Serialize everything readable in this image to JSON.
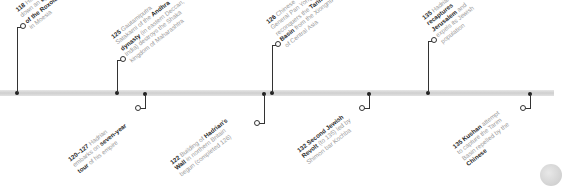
{
  "timeline": {
    "axis_color": "#d6d6d6",
    "events_above": [
      {
        "year": "118",
        "lines": [
          [
            {
              "t": "118 ",
              "b": true
            },
            {
              "t": "Hadrian puts",
              "b": false
            }
          ],
          [
            {
              "t": "down an ",
              "b": false
            },
            {
              "t": "uprising",
              "b": true
            }
          ],
          [
            {
              "t": "of the Roxolani",
              "b": true
            }
          ],
          [
            {
              "t": "in Moesia",
              "b": false
            }
          ]
        ]
      },
      {
        "year": "125",
        "lines": [
          [
            {
              "t": "125 ",
              "b": true
            },
            {
              "t": "Gautamiputra",
              "b": false
            }
          ],
          [
            {
              "t": "Satakarni of the ",
              "b": false
            },
            {
              "t": "Andhra",
              "b": true
            }
          ],
          [
            {
              "t": "dynasty",
              "b": true
            },
            {
              "t": " (in eastern Deccan,",
              "b": false
            }
          ],
          [
            {
              "t": "India) destroys the Shaka",
              "b": false
            }
          ],
          [
            {
              "t": "kingdom of Maharashtra",
              "b": false
            }
          ]
        ]
      },
      {
        "year": "126",
        "lines": [
          [
            {
              "t": "126 ",
              "b": true
            },
            {
              "t": "Chinese",
              "b": false
            }
          ],
          [
            {
              "t": "General Pan Yong",
              "b": false
            }
          ],
          [
            {
              "t": "reconquers the ",
              "b": false
            },
            {
              "t": "Tarim",
              "b": true
            }
          ],
          [
            {
              "t": "Basin",
              "b": true
            },
            {
              "t": " from the Xiongnu",
              "b": false
            }
          ],
          [
            {
              "t": "of Central Asia",
              "b": false
            }
          ]
        ]
      },
      {
        "year": "135",
        "lines": [
          [
            {
              "t": "135 ",
              "b": true
            },
            {
              "t": "Hadrian",
              "b": false
            }
          ],
          [
            {
              "t": "recaptures",
              "b": true
            }
          ],
          [
            {
              "t": "Jerusalem",
              "b": true
            },
            {
              "t": " and",
              "b": false
            }
          ],
          [
            {
              "t": "expels its Jewish",
              "b": false
            }
          ],
          [
            {
              "t": "population",
              "b": false
            }
          ]
        ]
      }
    ],
    "events_below": [
      {
        "year": "120-127",
        "lines": [
          [
            {
              "t": "120–127 ",
              "b": true
            },
            {
              "t": "Hadrian",
              "b": false
            }
          ],
          [
            {
              "t": "embarks on ",
              "b": false
            },
            {
              "t": "seven-year",
              "b": true
            }
          ],
          [
            {
              "t": "tour",
              "b": true
            },
            {
              "t": " of his empire",
              "b": false
            }
          ]
        ]
      },
      {
        "year": "122",
        "lines": [
          [
            {
              "t": "122 ",
              "b": true
            },
            {
              "t": "Building of ",
              "b": false
            },
            {
              "t": "Hadrian's",
              "b": true
            }
          ],
          [
            {
              "t": "Wall",
              "b": true
            },
            {
              "t": " in northern Britain",
              "b": false
            }
          ],
          [
            {
              "t": "begun (completed 126)",
              "b": false
            }
          ]
        ]
      },
      {
        "year": "132",
        "lines": [
          [
            {
              "t": "132 Second Jewish",
              "b": true
            }
          ],
          [
            {
              "t": "Revolt",
              "b": true
            },
            {
              "t": " (to 135) led by",
              "b": false
            }
          ],
          [
            {
              "t": "Shimon bar Kochba",
              "b": false
            }
          ]
        ]
      },
      {
        "year": "135",
        "lines": [
          [
            {
              "t": "135 Kushan",
              "b": true
            },
            {
              "t": " attempt",
              "b": false
            }
          ],
          [
            {
              "t": "to capture the Tarim",
              "b": false
            }
          ],
          [
            {
              "t": "Basin repelled by the",
              "b": false
            }
          ],
          [
            {
              "t": "Chinese",
              "b": true
            }
          ]
        ]
      }
    ]
  }
}
